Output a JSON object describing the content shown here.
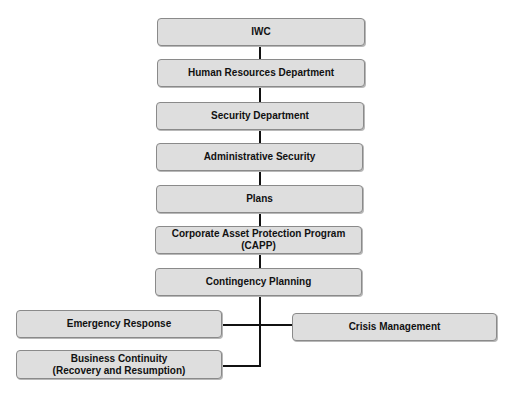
{
  "diagram": {
    "type": "org-chart",
    "colors": {
      "box_fill": "#dedede",
      "box_border": "#8a8a8a",
      "connector": "#111111",
      "text": "#111111"
    },
    "nodes": [
      {
        "id": "iwc",
        "label": "IWC"
      },
      {
        "id": "hr",
        "label": "Human Resources Department"
      },
      {
        "id": "security",
        "label": "Security Department"
      },
      {
        "id": "admin",
        "label": "Administrative Security"
      },
      {
        "id": "plans",
        "label": "Plans"
      },
      {
        "id": "capp",
        "label": "Corporate Asset Protection Program (CAPP)"
      },
      {
        "id": "contingency",
        "label": "Contingency Planning"
      },
      {
        "id": "emergency",
        "label": "Emergency Response"
      },
      {
        "id": "crisis",
        "label": "Crisis Management"
      },
      {
        "id": "business",
        "label_line1": "Business Continuity",
        "label_line2": "(Recovery and Resumption)"
      }
    ],
    "edges": [
      [
        "iwc",
        "hr"
      ],
      [
        "hr",
        "security"
      ],
      [
        "security",
        "admin"
      ],
      [
        "admin",
        "plans"
      ],
      [
        "plans",
        "capp"
      ],
      [
        "capp",
        "contingency"
      ],
      [
        "contingency",
        "emergency"
      ],
      [
        "contingency",
        "crisis"
      ],
      [
        "contingency",
        "business"
      ]
    ]
  }
}
